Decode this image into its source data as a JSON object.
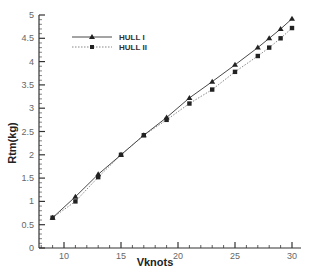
{
  "chart_data": {
    "type": "line",
    "title": "",
    "xlabel": "Vknots",
    "ylabel": "Rtm(kg)",
    "xlim": [
      7.8,
      30.8
    ],
    "ylim": [
      0,
      5
    ],
    "x_ticks": [
      10,
      15,
      20,
      25,
      30
    ],
    "y_ticks": [
      0,
      0.5,
      1,
      1.5,
      2,
      2.5,
      3,
      3.5,
      4,
      4.5,
      5
    ],
    "grid": false,
    "legend_position": "upper-left",
    "series": [
      {
        "name": "HULL I",
        "marker": "triangle",
        "line": "solid",
        "x": [
          9,
          11,
          13,
          15,
          17,
          19,
          21,
          23,
          25,
          27,
          28,
          29,
          30
        ],
        "y": [
          0.65,
          1.1,
          1.58,
          2.0,
          2.42,
          2.8,
          3.22,
          3.57,
          3.93,
          4.3,
          4.5,
          4.7,
          4.92
        ]
      },
      {
        "name": "HULL II",
        "marker": "square",
        "line": "dotted",
        "x": [
          9,
          11,
          13,
          15,
          17,
          19,
          21,
          23,
          25,
          27,
          28,
          29,
          30
        ],
        "y": [
          0.65,
          1.0,
          1.52,
          2.0,
          2.42,
          2.75,
          3.1,
          3.4,
          3.78,
          4.12,
          4.3,
          4.5,
          4.72
        ]
      }
    ]
  },
  "colors": {
    "axis": "#333333",
    "series1": "#333333",
    "series2": "#555555",
    "tick_label": "#666666"
  }
}
